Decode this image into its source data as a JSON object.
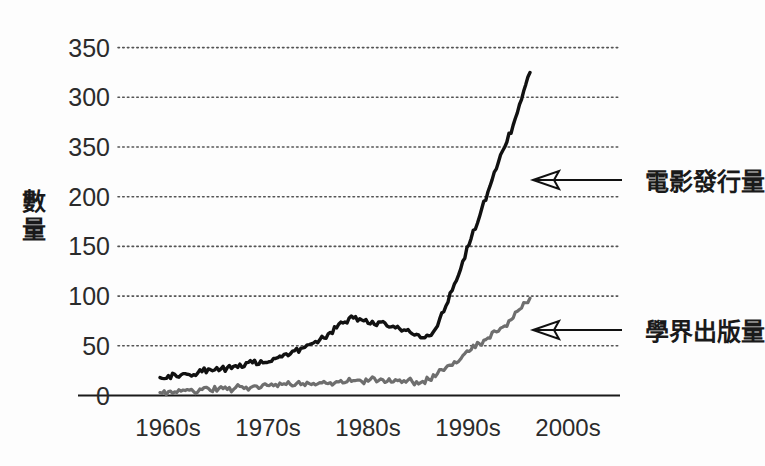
{
  "chart_data": {
    "type": "line",
    "title": "",
    "xlabel": "",
    "ylabel": "數量",
    "ylabel_chars": [
      "數",
      "量"
    ],
    "categories": [
      "1960s",
      "1970s",
      "1980s",
      "1990s",
      "2000s"
    ],
    "xtick_labels": [
      "1960s",
      "1970s",
      "1980s",
      "1990s",
      "2000s"
    ],
    "ytick_labels": [
      "350",
      "300",
      "350",
      "200",
      "150",
      "100",
      "50",
      "0"
    ],
    "ytick_values": [
      350,
      300,
      250,
      200,
      150,
      100,
      50,
      0
    ],
    "ylim": [
      0,
      350
    ],
    "xlim": [
      1958,
      2008
    ],
    "grid": true,
    "grid_style": "dotted-horizontal",
    "legend": "annotation-arrows",
    "legend_position": "right-inline",
    "series": [
      {
        "name": "電影發行量",
        "color": "#111111",
        "linewidth": 3.4,
        "annotation": "電影發行量",
        "x": [
          1959,
          1960,
          1961,
          1962,
          1963,
          1964,
          1965,
          1966,
          1967,
          1968,
          1969,
          1970,
          1971,
          1972,
          1973,
          1974,
          1975,
          1976,
          1977,
          1978,
          1979,
          1980,
          1981,
          1982,
          1983,
          1984,
          1985,
          1986,
          1987,
          1988,
          1989,
          1990,
          1991,
          1992,
          1993,
          1994,
          1995,
          1996,
          1997,
          1998,
          1999,
          2000,
          2001,
          2002,
          2003
        ],
        "values": [
          18,
          20,
          19,
          22,
          21,
          24,
          26,
          25,
          28,
          30,
          29,
          33,
          35,
          34,
          38,
          42,
          45,
          48,
          52,
          56,
          62,
          68,
          74,
          78,
          76,
          72,
          74,
          70,
          68,
          66,
          62,
          58,
          60,
          70,
          90,
          112,
          135,
          158,
          180,
          205,
          228,
          250,
          272,
          298,
          325
        ]
      },
      {
        "name": "學界出版量",
        "color": "#6e6e6e",
        "linewidth": 3.2,
        "annotation": "學界出版量",
        "x": [
          1959,
          1960,
          1961,
          1962,
          1963,
          1964,
          1965,
          1966,
          1967,
          1968,
          1969,
          1970,
          1971,
          1972,
          1973,
          1974,
          1975,
          1976,
          1977,
          1978,
          1979,
          1980,
          1981,
          1982,
          1983,
          1984,
          1985,
          1986,
          1987,
          1988,
          1989,
          1990,
          1991,
          1992,
          1993,
          1994,
          1995,
          1996,
          1997,
          1998,
          1999,
          2000,
          2001,
          2002,
          2003
        ],
        "values": [
          3,
          4,
          3,
          5,
          4,
          6,
          5,
          7,
          6,
          8,
          7,
          9,
          8,
          10,
          9,
          11,
          10,
          12,
          11,
          13,
          12,
          14,
          13,
          15,
          14,
          16,
          15,
          14,
          16,
          15,
          14,
          13,
          16,
          22,
          28,
          34,
          40,
          46,
          52,
          58,
          64,
          70,
          78,
          88,
          98
        ]
      }
    ],
    "annotations": [
      {
        "text": "電影發行量",
        "target_series": "電影發行量",
        "arrow_direction": "left"
      },
      {
        "text": "學界出版量",
        "target_series": "學界出版量",
        "arrow_direction": "left"
      }
    ]
  },
  "figure": {
    "background_color": "#fdfdfd",
    "axis_color": "#1a1a1a",
    "grid_color": "#555555"
  }
}
